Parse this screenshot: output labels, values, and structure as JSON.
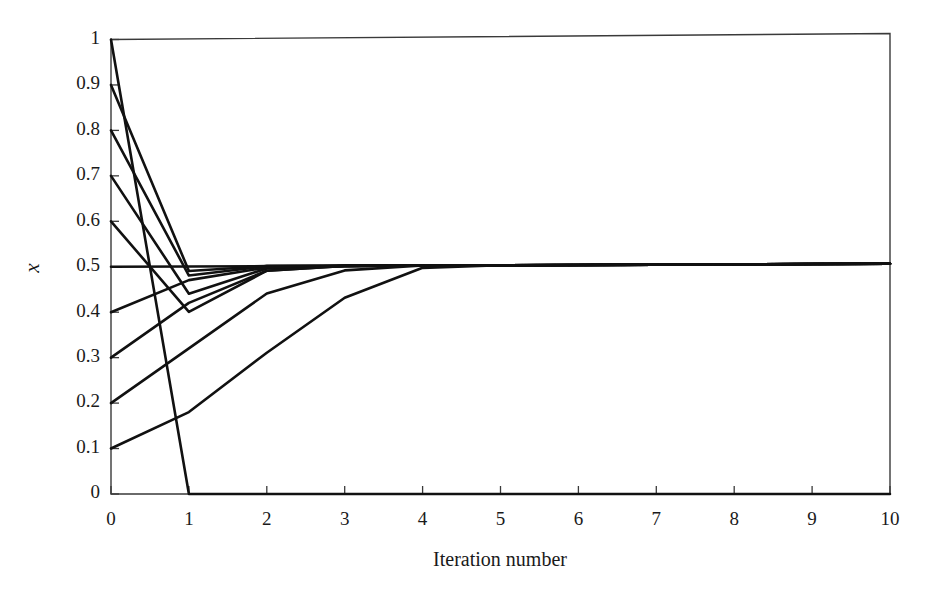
{
  "chart_data": {
    "type": "line",
    "title": "",
    "xlabel": "Iteration number",
    "ylabel": "x",
    "xlim": [
      0,
      10
    ],
    "ylim": [
      0,
      1
    ],
    "grid": false,
    "legend": "none",
    "xticks": [
      "0",
      "1",
      "2",
      "3",
      "4",
      "5",
      "6",
      "7",
      "8",
      "9",
      "10"
    ],
    "xtick_values": [
      0,
      1,
      2,
      3,
      4,
      5,
      6,
      7,
      8,
      9,
      10
    ],
    "yticks": [
      "0",
      "0.1",
      "0.2",
      "0.3",
      "0.4",
      "0.5",
      "0.6",
      "0.7",
      "0.8",
      "0.9",
      "1"
    ],
    "ytick_values": [
      0,
      0.1,
      0.2,
      0.3,
      0.4,
      0.5,
      0.6,
      0.7,
      0.8,
      0.9,
      1
    ],
    "x": [
      0,
      1,
      2,
      3,
      4,
      5,
      6,
      7,
      8,
      9,
      10
    ],
    "series": [
      {
        "name": "x0 = 1.0",
        "values": [
          1.0,
          0.0,
          0.0,
          0.0,
          0.0,
          0.0,
          0.0,
          0.0,
          0.0,
          0.0,
          0.0
        ]
      },
      {
        "name": "x0 = 0.9",
        "values": [
          0.9,
          0.49,
          0.5,
          0.5,
          0.5,
          0.5,
          0.5,
          0.5,
          0.5,
          0.5,
          0.5
        ]
      },
      {
        "name": "x0 = 0.8",
        "values": [
          0.8,
          0.48,
          0.5,
          0.5,
          0.5,
          0.5,
          0.5,
          0.5,
          0.5,
          0.5,
          0.5
        ]
      },
      {
        "name": "x0 = 0.7",
        "values": [
          0.7,
          0.44,
          0.495,
          0.5,
          0.5,
          0.5,
          0.5,
          0.5,
          0.5,
          0.5,
          0.5
        ]
      },
      {
        "name": "x0 = 0.6",
        "values": [
          0.6,
          0.4,
          0.49,
          0.5,
          0.5,
          0.5,
          0.5,
          0.5,
          0.5,
          0.5,
          0.5
        ]
      },
      {
        "name": "x0 = 0.5",
        "values": [
          0.5,
          0.5,
          0.5,
          0.5,
          0.5,
          0.5,
          0.5,
          0.5,
          0.5,
          0.5,
          0.5
        ]
      },
      {
        "name": "x0 = 0.4",
        "values": [
          0.4,
          0.47,
          0.497,
          0.5,
          0.5,
          0.5,
          0.5,
          0.5,
          0.5,
          0.5,
          0.5
        ]
      },
      {
        "name": "x0 = 0.3",
        "values": [
          0.3,
          0.42,
          0.49,
          0.5,
          0.5,
          0.5,
          0.5,
          0.5,
          0.5,
          0.5,
          0.5
        ]
      },
      {
        "name": "x0 = 0.2",
        "values": [
          0.2,
          0.32,
          0.44,
          0.49,
          0.5,
          0.5,
          0.5,
          0.5,
          0.5,
          0.5,
          0.5
        ]
      },
      {
        "name": "x0 = 0.1",
        "values": [
          0.1,
          0.18,
          0.31,
          0.43,
          0.495,
          0.5,
          0.5,
          0.5,
          0.5,
          0.5,
          0.5
        ]
      }
    ]
  },
  "axes": {
    "x_title": "Iteration number",
    "y_title": "x"
  }
}
